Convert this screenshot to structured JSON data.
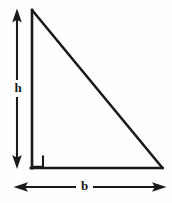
{
  "figure": {
    "background_color": "#fefefe",
    "stroke_color": "#1a1a1a",
    "width": 172,
    "height": 203
  },
  "shape": {
    "name": "right-triangle",
    "vertices": {
      "apex": {
        "x": 32,
        "y": 10
      },
      "bottom_left": {
        "x": 32,
        "y": 168
      },
      "bottom_right": {
        "x": 162,
        "y": 168
      }
    },
    "right_angle_marker": {
      "corner": "bottom-left",
      "size": 11
    }
  },
  "labels": {
    "height": "h",
    "base": "b"
  },
  "dimensions": {
    "height_arrow": {
      "label": "h",
      "orientation": "vertical",
      "double_headed": true,
      "x": 17,
      "y_top": 9,
      "y_bottom": 168,
      "label_x": 18,
      "label_y": 88
    },
    "base_arrow": {
      "label": "b",
      "orientation": "horizontal",
      "double_headed": true,
      "y": 187,
      "x_left": 14,
      "x_right": 166,
      "label_x": 84,
      "label_y": 186
    }
  }
}
